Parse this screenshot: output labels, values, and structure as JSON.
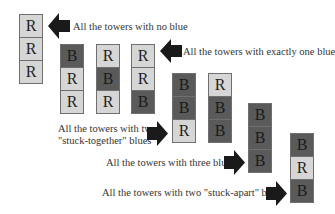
{
  "colors": {
    "red_cell": "#d6d6d6",
    "blue_cell": "#5a5a5a",
    "arrow": "#1a1a1a",
    "border": "#6f6f6f"
  },
  "towers": [
    {
      "id": "no-blue",
      "cells": [
        "R",
        "R",
        "R"
      ]
    },
    {
      "id": "one-blue-top",
      "cells": [
        "B",
        "R",
        "R"
      ]
    },
    {
      "id": "one-blue-middle",
      "cells": [
        "R",
        "B",
        "R"
      ]
    },
    {
      "id": "one-blue-bottom",
      "cells": [
        "R",
        "R",
        "B"
      ]
    },
    {
      "id": "two-together-top",
      "cells": [
        "B",
        "B",
        "R"
      ]
    },
    {
      "id": "two-together-bottom",
      "cells": [
        "R",
        "B",
        "B"
      ]
    },
    {
      "id": "three-blue",
      "cells": [
        "B",
        "B",
        "B"
      ]
    },
    {
      "id": "two-apart",
      "cells": [
        "B",
        "R",
        "B"
      ]
    }
  ],
  "labels": {
    "no_blue": "All the towers with no blue",
    "one_blue": "All the towers with exactly one blue",
    "two_together_line1": "All the towers with two",
    "two_together_line2": "\"stuck-together\" blues",
    "three_blues": "All the towers with three blues",
    "two_apart": "All the towers with two \"stuck-apart\" blues"
  },
  "arrows": [
    {
      "id": "arrow-no-blue",
      "direction": "left"
    },
    {
      "id": "arrow-one-blue",
      "direction": "left"
    },
    {
      "id": "arrow-two-together",
      "direction": "right"
    },
    {
      "id": "arrow-three-blues",
      "direction": "right"
    },
    {
      "id": "arrow-two-apart",
      "direction": "right"
    }
  ]
}
